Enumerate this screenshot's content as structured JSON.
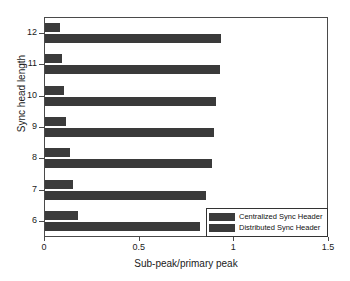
{
  "chart_data": {
    "type": "bar",
    "orientation": "horizontal",
    "title": "",
    "xlabel": "Sub-peak/primary peak",
    "ylabel": "Sync head length",
    "categories": [
      "6",
      "7",
      "8",
      "9",
      "10",
      "11",
      "12"
    ],
    "xlim": [
      0,
      1.5
    ],
    "xticks": [
      0,
      0.5,
      1,
      1.5
    ],
    "xtick_labels": [
      "0",
      "0.5",
      "1",
      "1.5"
    ],
    "ytick_labels": [
      "6",
      "7",
      "8",
      "9",
      "10",
      "11",
      "12"
    ],
    "grid": false,
    "legend_position": "lower right",
    "series": [
      {
        "name": "Centralized Sync Header",
        "color": "#3b3b3b",
        "values": [
          0.175,
          0.15,
          0.13,
          0.11,
          0.1,
          0.09,
          0.08
        ]
      },
      {
        "name": "Distributed Sync Header",
        "color": "#3a3a3a",
        "values": [
          0.82,
          0.85,
          0.88,
          0.895,
          0.905,
          0.925,
          0.93
        ]
      }
    ]
  },
  "legend": {
    "entries": [
      {
        "label": "Centralized Sync Header"
      },
      {
        "label": "Distributed Sync Header"
      }
    ]
  },
  "axes": {
    "x_label": "Sub-peak/primary peak",
    "y_label": "Sync head length"
  }
}
